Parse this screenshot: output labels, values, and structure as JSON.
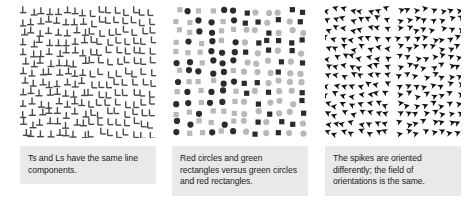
{
  "figure": {
    "background": "#ffffff",
    "panel_count": 3,
    "caption_background": "#e9e9e9",
    "caption_text_color": "#1a1a1a"
  },
  "panels": [
    {
      "id": "ts-and-ls",
      "caption": "Ts and Ls have the same line components.",
      "stimulus": {
        "type": "texture-segregation-line-elements",
        "left_element": "inverted-T",
        "right_element": "L",
        "element_color": "#4a4a4a",
        "stroke_width": 1.4,
        "columns": 16,
        "rows": 13,
        "divider_column": 8
      }
    },
    {
      "id": "circles-and-rectangles",
      "caption": "Red circles and green rectangles versus green circles and red rectangles.",
      "stimulus": {
        "type": "texture-segregation-color-shape",
        "left_shapes": [
          "circle-dark",
          "square-light"
        ],
        "right_shapes": [
          "square-dark",
          "circle-light"
        ],
        "dark_color": "#2b2b2b",
        "light_color": "#b8b8b8",
        "columns": 12,
        "rows": 13,
        "divider_column": 6
      }
    },
    {
      "id": "spikes",
      "caption": "The spikes are oriented differently; the field of orientations is the same.",
      "stimulus": {
        "type": "texture-segregation-orientation",
        "left_element": "spike-pointing-left",
        "right_element": "spike-pointing-right",
        "element_color": "#111111",
        "columns": 16,
        "rows": 14,
        "divider_column": 8
      }
    }
  ]
}
